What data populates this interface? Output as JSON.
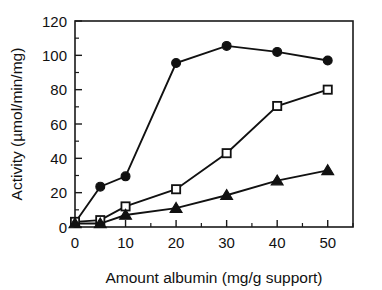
{
  "chart_data": {
    "type": "line",
    "title": "",
    "subtitle": "",
    "xlabel": "Amount albumin (mg/g support)",
    "ylabel": "Activity (µmol/min/mg)",
    "xlim": [
      0,
      55
    ],
    "ylim": [
      0,
      120
    ],
    "xticks": [
      0,
      10,
      20,
      30,
      40,
      50
    ],
    "xtick_labels": [
      "0",
      "10",
      "20",
      "30",
      "40",
      "50"
    ],
    "xminor_ticks": [
      5,
      15,
      25,
      35,
      45
    ],
    "yticks": [
      0,
      20,
      40,
      60,
      80,
      100,
      120
    ],
    "ytick_labels": [
      "0",
      "20",
      "40",
      "60",
      "80",
      "100",
      "120"
    ],
    "yminor_ticks": [
      10,
      30,
      50,
      70,
      90,
      110
    ],
    "grid": false,
    "legend": null,
    "legend_position": "none",
    "x": [
      0,
      5,
      10,
      20,
      30,
      40,
      50
    ],
    "series": [
      {
        "name": "filled-circle-series",
        "marker": "filled-circle",
        "values": [
          2.5,
          23.5,
          29.5,
          95.5,
          105.5,
          102,
          97
        ]
      },
      {
        "name": "open-square-series",
        "marker": "open-square",
        "values": [
          3,
          4,
          12,
          22,
          43,
          70.5,
          80
        ]
      },
      {
        "name": "filled-triangle-series",
        "marker": "filled-triangle",
        "values": [
          2,
          2,
          7,
          11,
          18.5,
          27,
          33
        ]
      }
    ]
  }
}
